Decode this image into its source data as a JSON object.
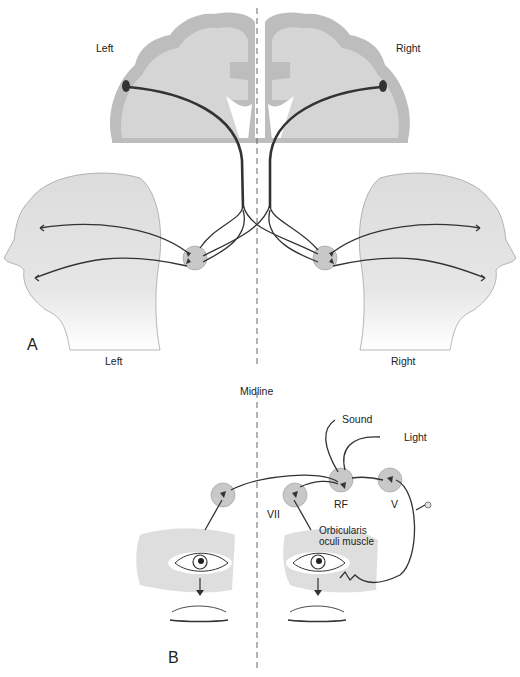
{
  "figure": {
    "panels": [
      {
        "id": "A",
        "label": "A",
        "brain_labels": {
          "left": "Left",
          "right": "Right"
        },
        "head_labels": {
          "left": "Left",
          "right": "Right"
        }
      },
      {
        "id": "B",
        "label": "B",
        "midline_label": "Midline",
        "stimuli": {
          "sound": "Sound",
          "light": "Light"
        },
        "nuclei": {
          "vii": "VII",
          "rf": "RF",
          "v": "V"
        },
        "muscle_label_line1": "Orbicularis",
        "muscle_label_line2": "oculi muscle"
      }
    ],
    "colors": {
      "gray_matter": "#bdbdbd",
      "white_matter": "#d5d5d5",
      "head_fill": "#dedede",
      "nerve": "#333333",
      "nucleus_fill": "#c8c8c8",
      "midline": "#666666"
    }
  }
}
